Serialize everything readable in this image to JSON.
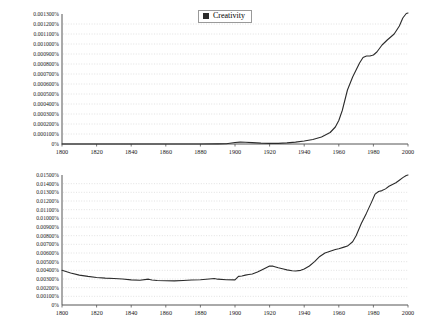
{
  "page": {
    "background_color": "#ffffff",
    "line_color": "#2b2b2b",
    "grid_color": "#cfcfcf",
    "axis_color": "#555555"
  },
  "charts": [
    {
      "id": "creativity",
      "legend_label": "Creativity",
      "legend_swatch_color": "#2b2b2b",
      "chart_data": {
        "type": "line",
        "title": "",
        "xlabel": "",
        "ylabel": "",
        "xlim": [
          1800,
          2000
        ],
        "ylim": [
          0,
          0.0013
        ],
        "grid": true,
        "legend_position": "top-center",
        "xticks": [
          1800,
          1820,
          1840,
          1860,
          1880,
          1900,
          1920,
          1940,
          1960,
          1980,
          2000
        ],
        "xtick_labels": [
          "1800",
          "1820",
          "1840",
          "1860",
          "1880",
          "1900",
          "1920",
          "1940",
          "1960",
          "1980",
          "2000"
        ],
        "yticks": [
          0,
          0.0001,
          0.0002,
          0.0003,
          0.0004,
          0.0005,
          0.0006,
          0.0007,
          0.0008,
          0.0009,
          0.001,
          0.0011,
          0.0012,
          0.0013
        ],
        "ytick_labels": [
          "0%",
          "0.000100%",
          "0.000200%",
          "0.000300%",
          "0.000400%",
          "0.000500%",
          "0.000600%",
          "0.000700%",
          "0.000800%",
          "0.000900%",
          "0.001000%",
          "0.001100%",
          "0.001200%",
          "0.001300%"
        ],
        "series": [
          {
            "name": "Creativity",
            "x": [
              1800,
              1810,
              1820,
              1830,
              1840,
              1850,
              1860,
              1870,
              1880,
              1890,
              1895,
              1900,
              1903,
              1906,
              1910,
              1915,
              1920,
              1925,
              1930,
              1935,
              1940,
              1945,
              1950,
              1955,
              1958,
              1960,
              1962,
              1965,
              1968,
              1970,
              1972,
              1974,
              1976,
              1978,
              1980,
              1982,
              1985,
              1988,
              1990,
              1992,
              1995,
              1997,
              1999,
              2000
            ],
            "y": [
              0.0,
              0.0,
              0.0,
              0.0,
              0.0,
              0.0,
              0.0,
              0.0,
              0.0,
              1e-06,
              3e-06,
              1.5e-05,
              1.9e-05,
              1.8e-05,
              1.4e-05,
              9e-06,
              6e-06,
              6e-06,
              1.1e-05,
              1.9e-05,
              3e-05,
              4.5e-05,
              7e-05,
              0.000115,
              0.00017,
              0.000235,
              0.000335,
              0.00054,
              0.00067,
              0.00074,
              0.00081,
              0.000865,
              0.00088,
              0.00088,
              0.00089,
              0.00092,
              0.00099,
              0.00104,
              0.00107,
              0.0011,
              0.00118,
              0.00126,
              0.001305,
              0.00131
            ]
          }
        ]
      }
    },
    {
      "id": "management",
      "legend_label": "Management",
      "legend_swatch_color": "#2b2b2b",
      "chart_data": {
        "type": "line",
        "title": "",
        "xlabel": "",
        "ylabel": "",
        "xlim": [
          1800,
          2000
        ],
        "ylim": [
          0,
          0.015
        ],
        "grid": true,
        "legend_position": "top-center",
        "xticks": [
          1800,
          1820,
          1840,
          1860,
          1880,
          1900,
          1920,
          1940,
          1960,
          1980,
          2000
        ],
        "xtick_labels": [
          "1800",
          "1820",
          "1840",
          "1860",
          "1880",
          "1900",
          "1920",
          "1940",
          "1960",
          "1980",
          "2000"
        ],
        "yticks": [
          0,
          0.001,
          0.002,
          0.003,
          0.004,
          0.005,
          0.006,
          0.007,
          0.008,
          0.009,
          0.01,
          0.011,
          0.012,
          0.013,
          0.014,
          0.015
        ],
        "ytick_labels": [
          "0%",
          "0.00100%",
          "0.00200%",
          "0.00300%",
          "0.00400%",
          "0.00500%",
          "0.00600%",
          "0.00700%",
          "0.00800%",
          "0.00900%",
          "0.01000%",
          "0.01100%",
          "0.01200%",
          "0.01300%",
          "0.01400%",
          "0.01500%"
        ],
        "series": [
          {
            "name": "Management",
            "x": [
              1800,
              1805,
              1810,
              1815,
              1820,
              1825,
              1830,
              1835,
              1840,
              1845,
              1850,
              1852,
              1855,
              1860,
              1865,
              1870,
              1875,
              1880,
              1885,
              1888,
              1890,
              1895,
              1900,
              1902,
              1904,
              1906,
              1908,
              1910,
              1913,
              1916,
              1918,
              1920,
              1922,
              1925,
              1928,
              1930,
              1933,
              1935,
              1938,
              1940,
              1943,
              1946,
              1949,
              1952,
              1955,
              1958,
              1960,
              1963,
              1965,
              1968,
              1970,
              1973,
              1976,
              1979,
              1981,
              1983,
              1985,
              1987,
              1989,
              1991,
              1993,
              1995,
              1997,
              1999,
              2000
            ],
            "y": [
              0.004,
              0.0037,
              0.00345,
              0.0033,
              0.00318,
              0.0031,
              0.00305,
              0.003,
              0.0029,
              0.00285,
              0.00298,
              0.00288,
              0.00283,
              0.0028,
              0.00278,
              0.00283,
              0.00288,
              0.00292,
              0.003,
              0.00305,
              0.00298,
              0.00292,
              0.0029,
              0.0033,
              0.00335,
              0.00345,
              0.00352,
              0.00358,
              0.0038,
              0.0041,
              0.0043,
              0.0045,
              0.00448,
              0.0043,
              0.00415,
              0.00405,
              0.00395,
              0.00393,
              0.004,
              0.00415,
              0.0045,
              0.005,
              0.0056,
              0.006,
              0.0062,
              0.0064,
              0.0065,
              0.00668,
              0.0068,
              0.0073,
              0.008,
              0.0094,
              0.0106,
              0.0119,
              0.0128,
              0.0131,
              0.0132,
              0.0134,
              0.0137,
              0.0139,
              0.0141,
              0.0144,
              0.0147,
              0.01495,
              0.015
            ]
          }
        ]
      }
    }
  ]
}
